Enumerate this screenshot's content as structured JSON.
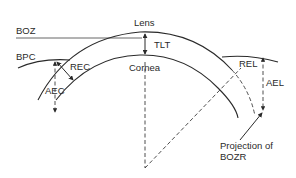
{
  "diagram": {
    "labels": {
      "boz": "BOZ",
      "bpc": "BPC",
      "lens": "Lens",
      "tlt": "TLT",
      "cornea": "Cornea",
      "rec": "REC",
      "aec": "AEC",
      "rel": "REL",
      "ael": "AEL",
      "projection_line1": "Projection of",
      "projection_line2": "BOZR"
    },
    "colors": {
      "line": "#2a2a2a",
      "background": "#ffffff"
    }
  }
}
